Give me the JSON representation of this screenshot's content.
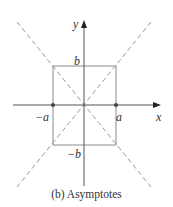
{
  "figure": {
    "caption": "(b) Asymptotes",
    "labels": {
      "x_axis": "x",
      "y_axis": "y",
      "pos_a": "a",
      "neg_a": "−a",
      "pos_b": "b",
      "neg_b": "−b"
    },
    "colors": {
      "axis": "#555555",
      "box": "#8a8a8a",
      "asymptote": "#9a9a9a",
      "vertex_dot": "#444444",
      "text": "#333333"
    },
    "elements": {
      "axes": [
        "x-axis",
        "y-axis"
      ],
      "rectangle": "central box with corners (±a, ±b)",
      "asymptotes": [
        "y = (b/a)x",
        "y = -(b/a)x"
      ],
      "vertex_points": [
        "(-a, 0)",
        "(a, 0)"
      ]
    }
  }
}
